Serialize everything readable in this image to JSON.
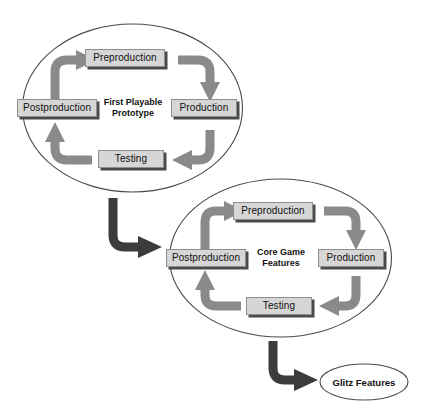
{
  "diagram": {
    "colors": {
      "box_fill": "#d6d6d6",
      "box_border": "#8e8e8e",
      "box_shadow": "#4a4a4a",
      "cycle_arrow": "#8a8a8a",
      "connector_arrow": "#3c3c3c",
      "ellipse_stroke": "#4a4a4a",
      "text": "#111111",
      "background": "#ffffff"
    },
    "cycles": [
      {
        "id": "first-playable-prototype",
        "hub_label": "First Playable\nPrototype",
        "stages": [
          {
            "id": "preproduction",
            "label": "Preproduction",
            "position": "top"
          },
          {
            "id": "production",
            "label": "Production",
            "position": "right"
          },
          {
            "id": "testing",
            "label": "Testing",
            "position": "bottom"
          },
          {
            "id": "postproduction",
            "label": "Postproduction",
            "position": "left"
          }
        ]
      },
      {
        "id": "core-game-features",
        "hub_label": "Core Game\nFeatures",
        "stages": [
          {
            "id": "preproduction",
            "label": "Preproduction",
            "position": "top"
          },
          {
            "id": "production",
            "label": "Production",
            "position": "right"
          },
          {
            "id": "testing",
            "label": "Testing",
            "position": "bottom"
          },
          {
            "id": "postproduction",
            "label": "Postproduction",
            "position": "left"
          }
        ]
      }
    ],
    "terminal": {
      "id": "glitz-features",
      "label": "Glitz Features"
    },
    "connectors": [
      {
        "id": "prototype-to-core",
        "from": "first-playable-prototype",
        "to": "core-game-features"
      },
      {
        "id": "core-to-glitz",
        "from": "core-game-features",
        "to": "glitz-features"
      }
    ]
  }
}
